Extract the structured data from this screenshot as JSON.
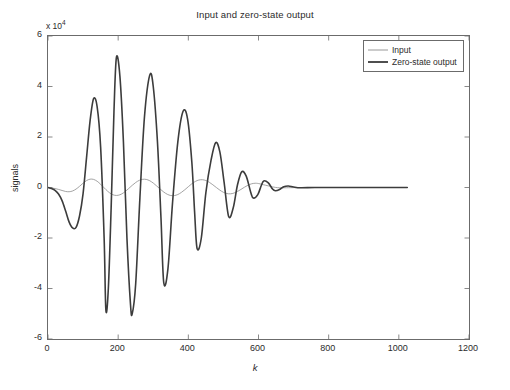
{
  "chart_data": {
    "type": "line",
    "title": "Input and zero-state output",
    "xlabel": "k",
    "ylabel": "signals",
    "y_multiplier": "x 10",
    "y_multiplier_exponent": "4",
    "grid": false,
    "legend_position": "top-right",
    "xlim": [
      0,
      1200
    ],
    "ylim": [
      -60000,
      60000
    ],
    "xticks": [
      0,
      200,
      400,
      600,
      800,
      1000,
      1200
    ],
    "xtick_labels": [
      "0",
      "200",
      "400",
      "600",
      "800",
      "1000",
      "1200"
    ],
    "yticks": [
      -60000,
      -40000,
      -20000,
      0,
      20000,
      40000,
      60000
    ],
    "ytick_labels": [
      "-6",
      "-4",
      "-2",
      "0",
      "2",
      "4",
      "6"
    ],
    "series": [
      {
        "name": "Input",
        "color": "#8c8c8c",
        "line_width": 0.8,
        "peak_amplitude": 3800,
        "comment_shape": "low-amplitude modulated oscillation, visible only near zero line, decays to zero by k=650",
        "points_x": [
          0,
          10,
          20,
          30,
          40,
          50,
          60,
          70,
          80,
          90,
          100,
          110,
          120,
          130,
          140,
          150,
          160,
          170,
          180,
          190,
          200,
          210,
          220,
          230,
          240,
          250,
          260,
          270,
          280,
          290,
          300,
          310,
          320,
          330,
          340,
          350,
          360,
          370,
          380,
          390,
          400,
          410,
          420,
          430,
          440,
          450,
          460,
          470,
          480,
          490,
          500,
          510,
          520,
          530,
          540,
          550,
          560,
          570,
          580,
          590,
          600,
          620,
          640,
          660,
          700,
          800,
          900,
          1000,
          1024
        ],
        "points_y": [
          0,
          -180,
          -420,
          -760,
          -1180,
          -1560,
          -1680,
          -1380,
          -620,
          480,
          1700,
          2750,
          3300,
          3200,
          2480,
          1280,
          -120,
          -1480,
          -2520,
          -3080,
          -3080,
          -2560,
          -1600,
          -400,
          850,
          1980,
          2820,
          3250,
          3200,
          2680,
          1760,
          580,
          -660,
          -1800,
          -2680,
          -3180,
          -3200,
          -2780,
          -1960,
          -880,
          320,
          1480,
          2400,
          2960,
          3080,
          2760,
          2050,
          1060,
          -20,
          -1060,
          -1900,
          -2400,
          -2500,
          -2200,
          -1580,
          -760,
          120,
          900,
          1450,
          1680,
          1560,
          900,
          260,
          -120,
          -60,
          0,
          0,
          0,
          0
        ]
      },
      {
        "name": "Zero-state output",
        "color": "#3c3c3c",
        "line_width": 1.6,
        "peak_amplitude": 51500,
        "comment_shape": "strongly amplified resonant response; largest positive peak ~5.15e4 near k=195, largest negative ~-5.0e4 near k=240; decays to zero by k=700",
        "key_peaks": [
          {
            "k": 80,
            "value": -16000
          },
          {
            "k": 130,
            "value": 35200
          },
          {
            "k": 165,
            "value": -48500
          },
          {
            "k": 195,
            "value": 51500
          },
          {
            "k": 240,
            "value": -50000
          },
          {
            "k": 290,
            "value": 44500
          },
          {
            "k": 330,
            "value": -37800
          },
          {
            "k": 385,
            "value": 30200
          },
          {
            "k": 425,
            "value": -24200
          },
          {
            "k": 478,
            "value": 17800
          },
          {
            "k": 515,
            "value": -11500
          },
          {
            "k": 552,
            "value": 6200
          },
          {
            "k": 585,
            "value": -4200
          },
          {
            "k": 615,
            "value": 2600
          },
          {
            "k": 648,
            "value": -1300
          }
        ],
        "points_x": [
          0,
          10,
          20,
          30,
          40,
          50,
          60,
          70,
          80,
          90,
          100,
          110,
          120,
          130,
          140,
          150,
          160,
          165,
          172,
          180,
          188,
          195,
          205,
          215,
          225,
          235,
          240,
          250,
          262,
          275,
          290,
          300,
          312,
          322,
          330,
          342,
          355,
          370,
          385,
          398,
          410,
          418,
          425,
          437,
          450,
          465,
          478,
          490,
          502,
          515,
          528,
          540,
          552,
          565,
          578,
          585,
          598,
          608,
          615,
          628,
          640,
          648,
          660,
          672,
          685,
          700,
          720,
          760,
          820,
          900,
          1000,
          1024
        ],
        "points_y": [
          0,
          -400,
          -1100,
          -2600,
          -5200,
          -9200,
          -13600,
          -16000,
          -15800,
          -11200,
          -2400,
          12000,
          26500,
          35200,
          32000,
          16000,
          -20000,
          -48500,
          -40000,
          -8000,
          30000,
          51500,
          44000,
          18000,
          -20000,
          -46000,
          -50000,
          -38000,
          -4000,
          28000,
          44500,
          40000,
          18000,
          -12000,
          -37800,
          -32000,
          -6000,
          18000,
          30200,
          27000,
          10000,
          -10000,
          -24200,
          -20000,
          -2000,
          11000,
          17800,
          14000,
          2000,
          -11500,
          -8000,
          1000,
          6200,
          4500,
          -2000,
          -4200,
          -2800,
          800,
          2600,
          1800,
          -600,
          -1300,
          -800,
          300,
          600,
          200,
          -100,
          0,
          0,
          0,
          0,
          0
        ]
      }
    ]
  },
  "legend": {
    "items": [
      {
        "label": "Input"
      },
      {
        "label": "Zero-state output"
      }
    ]
  },
  "figure": {
    "background_color": "#ffffff",
    "axis_color": "#6b6b6b",
    "text_color": "#2b2b2b"
  }
}
